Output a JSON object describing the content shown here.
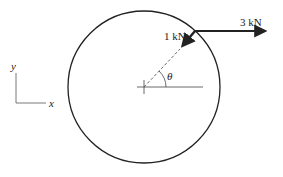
{
  "diagram": {
    "forces": [
      {
        "label": "3 kN",
        "direction": "horizontal right"
      },
      {
        "label": "1 kN",
        "direction": "toward center"
      }
    ],
    "angle_label": "θ",
    "axes": {
      "x_label": "x",
      "y_label": "y"
    },
    "colors": {
      "stroke": "#222222",
      "background": "#ffffff"
    }
  }
}
